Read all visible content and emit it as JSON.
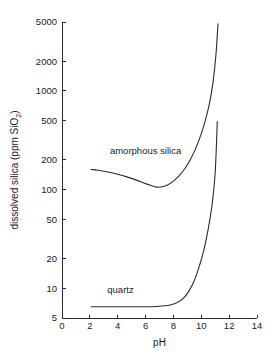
{
  "chart_data": {
    "type": "line",
    "title": "",
    "xlabel": "pH",
    "ylabel": "dissolved silica (ppm SiO2)",
    "ylabel_parts": {
      "main": "dissolved silica (ppm SiO",
      "subscript": "2",
      "tail": ")"
    },
    "yscale": "log",
    "xscale": "linear",
    "xlim": [
      0,
      14
    ],
    "ylim": [
      5,
      5000
    ],
    "grid": false,
    "legend": "inline-annotations",
    "xticks": [
      0,
      2,
      4,
      6,
      8,
      10,
      12,
      14
    ],
    "xtick_labels": [
      "0",
      "2",
      "4",
      "6",
      "8",
      "10",
      "12",
      "14"
    ],
    "yticks": [
      5,
      10,
      20,
      50,
      100,
      200,
      500,
      1000,
      2000,
      5000
    ],
    "ytick_labels": [
      "5",
      "10",
      "20",
      "50",
      "100",
      "200",
      "500",
      "1000",
      "2000",
      "5000"
    ],
    "series": [
      {
        "name": "amorphous silica",
        "label": "amorphous silica",
        "label_x": 6.0,
        "label_y": 230,
        "color": "#2b2b2b",
        "x": [
          2.1,
          2.6,
          3.2,
          3.8,
          4.4,
          5.0,
          5.6,
          6.0,
          6.4,
          6.8,
          7.2,
          7.6,
          8.0,
          8.4,
          8.8,
          9.2,
          9.6,
          10.0,
          10.3,
          10.6,
          10.85,
          11.05,
          11.2
        ],
        "y": [
          160,
          157,
          152,
          146,
          138,
          130,
          121,
          115,
          110,
          106,
          107,
          112,
          122,
          138,
          162,
          200,
          262,
          370,
          510,
          760,
          1250,
          2300,
          4800
        ]
      },
      {
        "name": "quartz",
        "label": "quartz",
        "label_x": 4.2,
        "label_y": 9.0,
        "color": "#2b2b2b",
        "x": [
          2.1,
          3.0,
          4.0,
          5.0,
          6.0,
          6.8,
          7.4,
          7.9,
          8.3,
          8.7,
          9.1,
          9.5,
          9.9,
          10.2,
          10.5,
          10.8,
          11.0,
          11.15
        ],
        "y": [
          6.5,
          6.5,
          6.5,
          6.5,
          6.5,
          6.55,
          6.65,
          6.85,
          7.2,
          7.9,
          9.3,
          12.0,
          17.5,
          25.0,
          40.0,
          75.0,
          150.0,
          490.0
        ]
      }
    ]
  },
  "figure": {
    "background_color": "#ffffff",
    "axis_color": "#2b2b2b",
    "line_color": "#2b2b2b"
  }
}
